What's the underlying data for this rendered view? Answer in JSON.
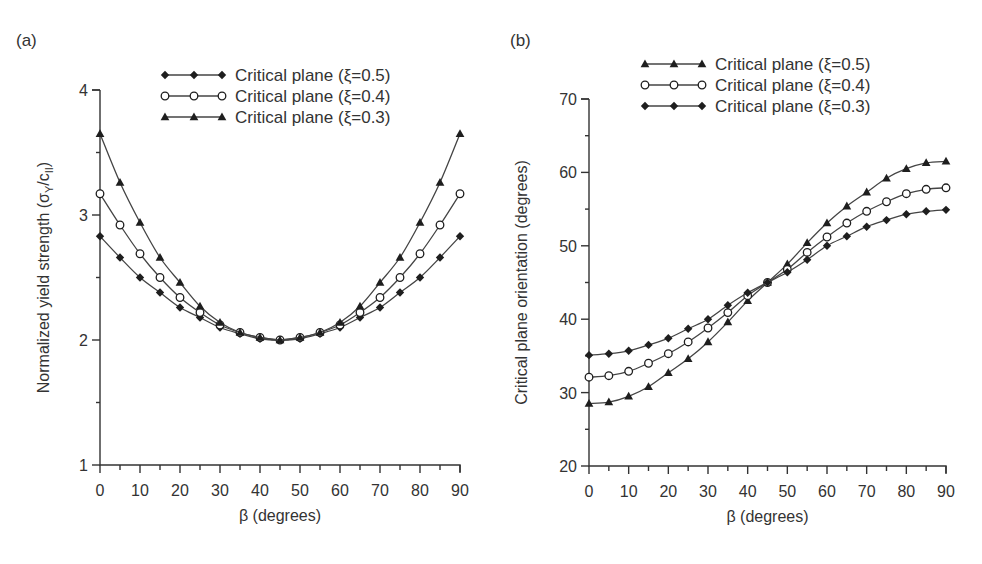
{
  "chart_data": [
    {
      "type": "line",
      "panel_label": "(a)",
      "title": "",
      "xlabel": "β (degrees)",
      "ylabel": "Normalized yield strength (σY/cII)",
      "ylabel_parts": {
        "main": "Normalized yield strength (σ",
        "sub1": "Y",
        "mid": "/c",
        "sub2": "II",
        "end": ")"
      },
      "xlim": [
        0,
        90
      ],
      "ylim": [
        1,
        4
      ],
      "xticks": [
        0,
        10,
        20,
        30,
        40,
        50,
        60,
        70,
        80,
        90
      ],
      "yticks": [
        1,
        2,
        3,
        4
      ],
      "grid": false,
      "legend_position": "top-center",
      "x": [
        0,
        5,
        10,
        15,
        20,
        25,
        30,
        35,
        40,
        45,
        50,
        55,
        60,
        65,
        70,
        75,
        80,
        85,
        90
      ],
      "series": [
        {
          "name": "Critical plane (ξ=0.5)",
          "marker": "diamond",
          "values": [
            2.83,
            2.66,
            2.5,
            2.38,
            2.26,
            2.18,
            2.1,
            2.05,
            2.01,
            2.0,
            2.01,
            2.05,
            2.1,
            2.18,
            2.26,
            2.38,
            2.5,
            2.66,
            2.83
          ]
        },
        {
          "name": "Critical plane (ξ=0.4)",
          "marker": "circle",
          "values": [
            3.17,
            2.92,
            2.69,
            2.5,
            2.34,
            2.22,
            2.12,
            2.06,
            2.02,
            2.0,
            2.02,
            2.06,
            2.12,
            2.22,
            2.34,
            2.5,
            2.69,
            2.92,
            3.17
          ]
        },
        {
          "name": "Critical plane (ξ=0.3)",
          "marker": "triangle",
          "values": [
            3.65,
            3.26,
            2.94,
            2.66,
            2.46,
            2.27,
            2.14,
            2.06,
            2.02,
            2.0,
            2.02,
            2.06,
            2.14,
            2.27,
            2.46,
            2.66,
            2.94,
            3.26,
            3.65
          ]
        }
      ]
    },
    {
      "type": "line",
      "panel_label": "(b)",
      "title": "",
      "xlabel": "β (degrees)",
      "ylabel": "Critical plane orientation (degrees)",
      "xlim": [
        0,
        90
      ],
      "ylim": [
        20,
        70
      ],
      "xticks": [
        0,
        10,
        20,
        30,
        40,
        50,
        60,
        70,
        80,
        90
      ],
      "yticks": [
        20,
        30,
        40,
        50,
        60,
        70
      ],
      "grid": false,
      "legend_position": "top-center",
      "x": [
        0,
        5,
        10,
        15,
        20,
        25,
        30,
        35,
        40,
        45,
        50,
        55,
        60,
        65,
        70,
        75,
        80,
        85,
        90
      ],
      "series": [
        {
          "name": "Critical plane (ξ=0.5)",
          "marker": "triangle",
          "values": [
            28.5,
            28.7,
            29.5,
            30.8,
            32.7,
            34.6,
            36.9,
            39.6,
            42.5,
            45.0,
            47.5,
            50.4,
            53.1,
            55.4,
            57.3,
            59.2,
            60.5,
            61.3,
            61.5
          ]
        },
        {
          "name": "Critical plane (ξ=0.4)",
          "marker": "circle",
          "values": [
            32.1,
            32.3,
            32.9,
            34.0,
            35.3,
            36.9,
            38.8,
            40.9,
            43.2,
            45.0,
            46.8,
            49.1,
            51.2,
            53.1,
            54.7,
            56.0,
            57.1,
            57.7,
            57.9
          ]
        },
        {
          "name": "Critical plane (ξ=0.3)",
          "marker": "diamond",
          "values": [
            35.1,
            35.3,
            35.7,
            36.5,
            37.4,
            38.7,
            40.0,
            41.9,
            43.6,
            45.0,
            46.4,
            48.1,
            50.0,
            51.3,
            52.6,
            53.5,
            54.3,
            54.7,
            54.9
          ]
        }
      ]
    }
  ],
  "layout": {
    "panels": [
      {
        "x0": 100,
        "x1": 460,
        "y0": 465,
        "y1": 90,
        "panel_label_pos": [
          16,
          46
        ],
        "ylabel_x": 43,
        "legend": {
          "x": 165,
          "y": 75,
          "dy": 21
        }
      },
      {
        "x0": 589,
        "x1": 946,
        "y0": 466,
        "y1": 99,
        "panel_label_pos": [
          510,
          46
        ],
        "ylabel_x": 521,
        "legend": {
          "x": 645,
          "y": 64,
          "dy": 21
        }
      }
    ]
  },
  "colors": {
    "line": "#444444",
    "marker": "#1e1e1e",
    "axis": "#333333",
    "text": "#333333"
  }
}
